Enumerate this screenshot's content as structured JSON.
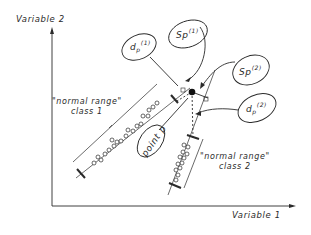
{
  "diagram": {
    "axes": {
      "x_label": "Variable 1",
      "y_label": "Variable 2"
    },
    "classes": [
      {
        "name": "class 1",
        "range_label": "\"normal range\"",
        "class_label": "class 1"
      },
      {
        "name": "class 2",
        "range_label": "\"normal range\"",
        "class_label": "class 2"
      }
    ],
    "callouts": {
      "sp1": {
        "base": "Sp",
        "sup": "(1)"
      },
      "sp2": {
        "base": "Sp",
        "sup": "(2)"
      },
      "dp1": {
        "base": "d",
        "sub": "p",
        "sup": "(1)"
      },
      "dp2": {
        "base": "d",
        "sub": "p",
        "sup": "(2)"
      },
      "point": "point p"
    },
    "colors": {
      "ink": "#2a2a2a",
      "background": "#ffffff"
    }
  }
}
